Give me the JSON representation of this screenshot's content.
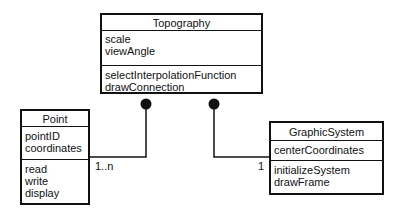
{
  "diagram": {
    "type": "UML class diagram",
    "classes": [
      {
        "id": "topography",
        "name": "Topography",
        "attributes": [
          "scale",
          "viewAngle"
        ],
        "operations": [
          "selectInterpolationFunction",
          "drawConnection"
        ]
      },
      {
        "id": "point",
        "name": "Point",
        "attributes": [
          "pointID",
          "coordinates"
        ],
        "operations": [
          "read",
          "write",
          "display"
        ]
      },
      {
        "id": "graphicsystem",
        "name": "GraphicSystem",
        "attributes": [
          "centerCoordinates"
        ],
        "operations": [
          "initializeSystem",
          "drawFrame"
        ]
      }
    ],
    "associations": [
      {
        "from": "Topography",
        "to": "Point",
        "kind": "composition",
        "multiplicity": "1..n"
      },
      {
        "from": "Topography",
        "to": "GraphicSystem",
        "kind": "composition",
        "multiplicity": "1"
      }
    ],
    "colors": {
      "line": "#111111",
      "background": "#ffffff"
    }
  }
}
